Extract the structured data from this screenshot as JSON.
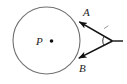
{
  "figure": {
    "type": "geometry-diagram",
    "background_color": "#ffffff",
    "stroke_color": "#4a4a4a",
    "line_color": "#1c1c1c",
    "label_color": "#1c1c1c",
    "width": 127,
    "height": 84
  },
  "circle": {
    "center_label": "P",
    "center_x": 46.5,
    "center_y": 40.5,
    "radius": 33.5,
    "stroke_color": "#707070",
    "stroke_width": 1,
    "fill": "none"
  },
  "center_dot": {
    "label": "center-point",
    "x": 51.5,
    "y": 41,
    "radius": 1.8,
    "color": "#111111"
  },
  "labels": [
    {
      "text": "P",
      "x": 36,
      "y": 45
    },
    {
      "text": "A",
      "x": 83,
      "y": 16
    },
    {
      "text": "B",
      "x": 79,
      "y": 72
    }
  ],
  "points": [
    {
      "name": "A",
      "x": 78,
      "y": 21
    },
    {
      "name": "B",
      "x": 77.5,
      "y": 59
    },
    {
      "name": "V",
      "x": 112.5,
      "y": 41
    }
  ],
  "segments": [
    {
      "name": "tangent-segment-a",
      "x1": 112.5,
      "y1": 41,
      "x2": 78,
      "y2": 21,
      "arrow": "start"
    },
    {
      "name": "tangent-segment-b",
      "x1": 112.5,
      "y1": 41,
      "x2": 77.5,
      "y2": 59,
      "arrow": "start"
    },
    {
      "name": "vertex-ray",
      "x1": 112.5,
      "y1": 41,
      "x2": 123,
      "y2": 41,
      "arrow": "none"
    }
  ],
  "angle_arc": {
    "name": "vertex-angle-arc",
    "cx": 112.5,
    "cy": 41,
    "radius": 9,
    "stroke_color": "#333333"
  },
  "tick_mark": {
    "name": "tangent-congruence-tick",
    "x1": 104,
    "y1": 28,
    "x2": 108,
    "y2": 25.5,
    "color": "#8a8a8a"
  }
}
